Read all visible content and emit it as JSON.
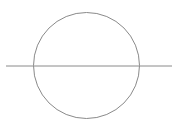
{
  "canvas": {
    "width": 178,
    "height": 131,
    "background_color": "#ffffff",
    "title": "Circle with horizontal secant line"
  },
  "chart_data": {
    "type": "scatter",
    "subtitle": "",
    "xlabel": "",
    "ylabel": "",
    "grid": false,
    "legend": null,
    "xlim": [
      0,
      178
    ],
    "ylim": [
      0,
      131
    ],
    "shapes": [
      {
        "name": "circle",
        "kind": "circle",
        "cx": 86.5,
        "cy": 65.5,
        "r": 53,
        "stroke": "#8a8a8a",
        "stroke_width": 1,
        "fill": "none"
      },
      {
        "name": "horizontal-line",
        "kind": "line",
        "x1": 6,
        "y1": 66,
        "x2": 172,
        "y2": 66,
        "stroke": "#8a8a8a",
        "stroke_width": 1
      }
    ],
    "annotations": []
  },
  "figure": {
    "circle": {
      "label": "circle",
      "cx": 86.5,
      "cy": 65.5,
      "r": 53,
      "stroke_color": "#8a8a8a",
      "stroke_width": 1,
      "fill": "none"
    },
    "line": {
      "label": "horizontal line",
      "x1": 6,
      "y1": 66,
      "x2": 172,
      "y2": 66,
      "stroke_color": "#8a8a8a",
      "stroke_width": 1
    }
  }
}
